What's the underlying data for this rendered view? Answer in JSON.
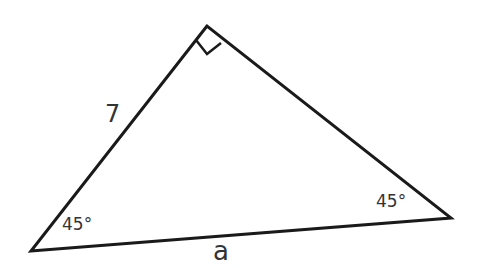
{
  "diagram": {
    "type": "right-triangle",
    "vertices": {
      "top": [
        207,
        26
      ],
      "left": [
        31,
        251
      ],
      "right": [
        451,
        218
      ]
    },
    "right_angle_at": "top",
    "labels": {
      "side_left": "7",
      "side_bottom": "a",
      "angle_left": "45°",
      "angle_right": "45°"
    },
    "colors": {
      "stroke": "#1a1a1a",
      "text": "#333333",
      "background": "#ffffff"
    }
  }
}
